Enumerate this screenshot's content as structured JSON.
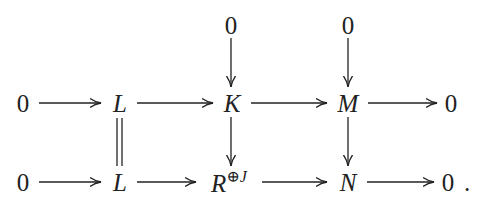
{
  "diagram": {
    "type": "commutative-diagram",
    "nodes": {
      "top_k_zero": "0",
      "top_m_zero": "0",
      "r1_zero_left": "0",
      "r1_L": "L",
      "r1_K": "K",
      "r1_M": "M",
      "r1_zero_right": "0",
      "r2_zero_left": "0",
      "r2_L": "L",
      "r2_R": "R",
      "r2_R_sup_op": "⊕",
      "r2_R_sup_index": "J",
      "r2_N": "N",
      "r2_zero_right": "0",
      "r2_period": "."
    },
    "arrows": [
      {
        "from": "r1_zero_left",
        "to": "r1_L",
        "style": "arrow"
      },
      {
        "from": "r1_L",
        "to": "r1_K",
        "style": "arrow"
      },
      {
        "from": "r1_K",
        "to": "r1_M",
        "style": "arrow"
      },
      {
        "from": "r1_M",
        "to": "r1_zero_right",
        "style": "arrow"
      },
      {
        "from": "r2_zero_left",
        "to": "r2_L",
        "style": "arrow"
      },
      {
        "from": "r2_L",
        "to": "r2_R",
        "style": "arrow"
      },
      {
        "from": "r2_R",
        "to": "r2_N",
        "style": "arrow"
      },
      {
        "from": "r2_N",
        "to": "r2_zero_right",
        "style": "arrow"
      },
      {
        "from": "top_k_zero",
        "to": "r1_K",
        "style": "arrow"
      },
      {
        "from": "top_m_zero",
        "to": "r1_M",
        "style": "arrow"
      },
      {
        "from": "r1_K",
        "to": "r2_R",
        "style": "arrow"
      },
      {
        "from": "r1_M",
        "to": "r2_N",
        "style": "arrow"
      },
      {
        "from": "r1_L",
        "to": "r2_L",
        "style": "equality"
      }
    ],
    "colors": {
      "ink": "#222222",
      "background": "#ffffff"
    }
  }
}
